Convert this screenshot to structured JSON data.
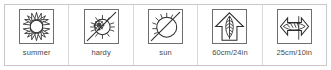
{
  "legend": {
    "title": "Plant care symbol legend",
    "border_color": "#c9c9c9",
    "icon_stroke_color": "#2b2b2b",
    "caption_color": "#4a4a4a",
    "background_color": "#ffffff",
    "cells": [
      {
        "id": "summer",
        "caption": "summer",
        "icon_name": "sun-rays-icon",
        "meaning": "flowering season summer"
      },
      {
        "id": "hardy",
        "caption": "hardy",
        "icon_name": "sun-crossed-hardy-icon",
        "meaning": "hardy plant"
      },
      {
        "id": "sun",
        "caption": "sun",
        "icon_name": "sun-half-rays-icon",
        "meaning": "full sun position"
      },
      {
        "id": "height",
        "caption": "60cm/24in",
        "icon_name": "plant-height-arrow-icon",
        "meaning": "plant height 60cm / 24in"
      },
      {
        "id": "spread",
        "caption": "25cm/10in",
        "icon_name": "plant-spread-arrow-icon",
        "meaning": "plant spread 25cm / 10in"
      }
    ]
  }
}
